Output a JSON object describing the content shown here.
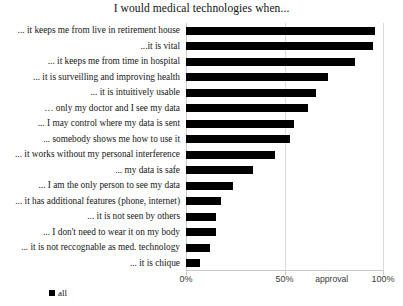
{
  "chart_data": {
    "type": "bar",
    "orientation": "horizontal",
    "title": "I would medical technologies when...",
    "xlabel": "approval",
    "ylabel": "",
    "xlim": [
      0,
      100
    ],
    "xticks": [
      "0%",
      "50%",
      "100%"
    ],
    "xtick_values": [
      0,
      50,
      100
    ],
    "grid": true,
    "legend_position": "bottom-left",
    "categories": [
      "... it keeps me from live in retirement house",
      "...it is vital",
      "... it keeps me from time in hospital",
      "... it is surveilling and improving health",
      "... it is intuitively usable",
      "… only my doctor and I see my data",
      "... I may control where my data is sent",
      "... somebody shows me how to use it",
      "... it works without my personal interference",
      "... my data is safe",
      "... I am the only person to see my data",
      "... it has additional features (phone, internet)",
      "... it is not seen by others",
      "... I don't need to wear it on my body",
      "... it is not reccognable as med. technology",
      "... it is chique"
    ],
    "series": [
      {
        "name": "all",
        "color": "#000000",
        "values": [
          96,
          95,
          86,
          72,
          66,
          62,
          55,
          53,
          45,
          34,
          24,
          18,
          15,
          15,
          12,
          7
        ]
      }
    ]
  }
}
